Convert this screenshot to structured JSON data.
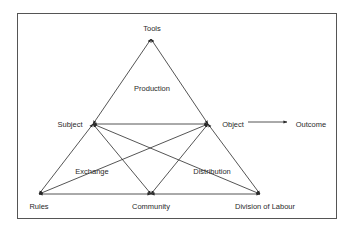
{
  "diagram": {
    "nodes": {
      "tools": {
        "label": "Tools",
        "x": 151,
        "y": 39,
        "lx": 152,
        "ly": 29
      },
      "subject": {
        "label": "Subject",
        "x": 93,
        "y": 124,
        "lx": 70,
        "ly": 125
      },
      "object": {
        "label": "Object",
        "x": 208,
        "y": 124,
        "lx": 233,
        "ly": 125
      },
      "outcome": {
        "label": "Outcome",
        "x": 290,
        "y": 124,
        "lx": 311,
        "ly": 125
      },
      "rules": {
        "label": "Rules",
        "x": 39,
        "y": 194,
        "lx": 39,
        "ly": 207
      },
      "community": {
        "label": "Community",
        "x": 151,
        "y": 194,
        "lx": 151,
        "ly": 207
      },
      "division": {
        "label": "Division of Labour",
        "x": 260,
        "y": 194,
        "lx": 265,
        "ly": 207
      }
    },
    "regions": {
      "production": {
        "label": "Production",
        "x": 152,
        "y": 89
      },
      "exchange": {
        "label": "Exchange",
        "x": 92,
        "y": 172
      },
      "distribution": {
        "label": "Distribution",
        "x": 212,
        "y": 172
      }
    },
    "edges": [
      {
        "from": "subject",
        "to": "tools",
        "type": "double"
      },
      {
        "from": "tools",
        "to": "object",
        "type": "double"
      },
      {
        "from": "subject",
        "to": "object",
        "type": "double"
      },
      {
        "from": "subject",
        "to": "rules",
        "type": "double"
      },
      {
        "from": "subject",
        "to": "community",
        "type": "double"
      },
      {
        "from": "subject",
        "to": "division",
        "type": "double"
      },
      {
        "from": "object",
        "to": "rules",
        "type": "double"
      },
      {
        "from": "object",
        "to": "community",
        "type": "double"
      },
      {
        "from": "object",
        "to": "division",
        "type": "double"
      },
      {
        "from": "rules",
        "to": "community",
        "type": "double"
      },
      {
        "from": "community",
        "to": "division",
        "type": "double"
      },
      {
        "from": "object",
        "to": "outcome",
        "type": "single"
      }
    ],
    "colors": {
      "line": "#2a2a2a",
      "frame": "#555555",
      "background": "#ffffff"
    }
  }
}
